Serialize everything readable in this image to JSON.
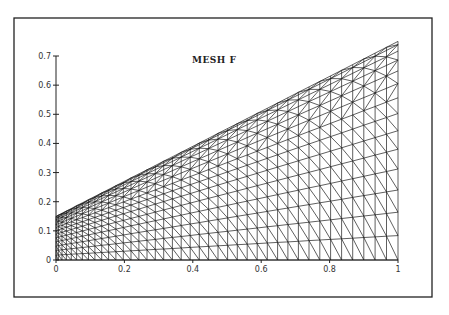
{
  "chart_data": {
    "type": "mesh",
    "title": "MESH F",
    "xlabel": "",
    "ylabel": "",
    "xlim": [
      0,
      1
    ],
    "ylim": [
      0,
      0.7
    ],
    "x_ticks": [
      "0",
      "0.2",
      "0.4",
      "0.6",
      "0.8",
      "1"
    ],
    "y_ticks": [
      "0",
      "0.1",
      "0.2",
      "0.3",
      "0.4",
      "0.5",
      "0.6",
      "0.7"
    ],
    "grid": false,
    "legend": null,
    "domain_shape": {
      "description": "Trapezoidal domain: bottom edge y=0 from x=0 to x=1, left edge height 0.15, right edge height 0.75, straight top edge",
      "vertices": [
        [
          0,
          0
        ],
        [
          1,
          0
        ],
        [
          1,
          0.75
        ],
        [
          0,
          0.15
        ]
      ]
    },
    "mesh": {
      "element_type": "triangular",
      "columns": 40,
      "rows": 14,
      "x_grading": "denser near x=0",
      "y_grading": "denser near top edge"
    }
  },
  "colors": {
    "line": "#1a1a1a",
    "background": "#ffffff"
  }
}
